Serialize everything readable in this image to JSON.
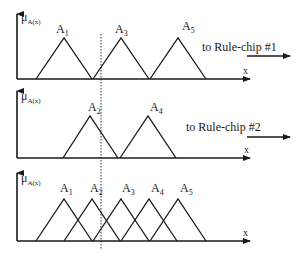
{
  "diagram": {
    "title": "",
    "stroke_color": "#1a1a1a",
    "background": "#ffffff",
    "panels": [
      {
        "id": "panel-1",
        "y_axis_label": "μ",
        "y_axis_sub": "A(x)",
        "x_axis_label": "x",
        "output_label": "to Rule-chip #1",
        "sets": [
          {
            "name": "A",
            "sub": "1",
            "left": 36,
            "peak": 64,
            "right": 92
          },
          {
            "name": "A",
            "sub": "3",
            "left": 93,
            "peak": 121,
            "right": 149
          },
          {
            "name": "A",
            "sub": "5",
            "left": 150,
            "peak": 178,
            "right": 206
          }
        ]
      },
      {
        "id": "panel-2",
        "y_axis_label": "μ",
        "y_axis_sub": "A(x)",
        "x_axis_label": "x",
        "output_label": "to Rule-chip #2",
        "sets": [
          {
            "name": "A",
            "sub": "2",
            "left": 63,
            "peak": 90,
            "right": 118
          },
          {
            "name": "A",
            "sub": "4",
            "left": 120,
            "peak": 148,
            "right": 176
          }
        ]
      },
      {
        "id": "panel-3",
        "y_axis_label": "μ",
        "y_axis_sub": "A(x)",
        "x_axis_label": "x",
        "output_label": "",
        "sets": [
          {
            "name": "A",
            "sub": "1",
            "left": 36,
            "peak": 64,
            "right": 92
          },
          {
            "name": "A",
            "sub": "2",
            "left": 64,
            "peak": 92,
            "right": 120
          },
          {
            "name": "A",
            "sub": "3",
            "left": 93,
            "peak": 121,
            "right": 149
          },
          {
            "name": "A",
            "sub": "4",
            "left": 121,
            "peak": 149,
            "right": 177
          },
          {
            "name": "A",
            "sub": "5",
            "left": 150,
            "peak": 178,
            "right": 206
          }
        ]
      }
    ],
    "input_marker": {
      "x": 101,
      "style": "dotted"
    }
  }
}
